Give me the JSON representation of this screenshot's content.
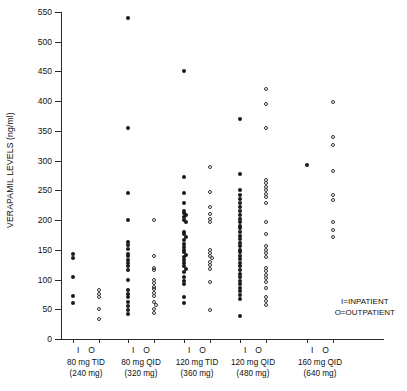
{
  "chart_data": {
    "type": "scatter",
    "title": "",
    "xlabel": "",
    "ylabel": "VERAPAMIL LEVELS (ng/ml)",
    "ylim": [
      0,
      550
    ],
    "ytick_step": 50,
    "yticks": [
      0,
      50,
      100,
      150,
      200,
      250,
      300,
      350,
      400,
      450,
      500,
      550
    ],
    "grid": false,
    "legend_position": "bottom-right",
    "legend": [
      {
        "symbol": "I",
        "label": "I=INPATIENT",
        "marker": "filled-circle"
      },
      {
        "symbol": "O",
        "label": "O=OUTPATIENT",
        "marker": "open-circle"
      }
    ],
    "column_labels": [
      "I",
      "O"
    ],
    "groups": [
      {
        "name": "80 mg TID",
        "dose_line1": "80 mg TID",
        "dose_line2": "(240 mg)",
        "total_dose_mg": 240,
        "series": [
          {
            "name": "I",
            "marker": "filled-circle",
            "values": [
              143,
              137,
              105,
              73,
              60
            ]
          },
          {
            "name": "O",
            "marker": "open-circle",
            "values": [
              82,
              76,
              71,
              50,
              33
            ]
          }
        ]
      },
      {
        "name": "80 mg QID",
        "dose_line1": "80 mg QID",
        "dose_line2": "(320 mg)",
        "total_dose_mg": 320,
        "series": [
          {
            "name": "I",
            "marker": "filled-circle",
            "values": [
              540,
              355,
              245,
              200,
              163,
              158,
              152,
              143,
              139,
              133,
              128,
              122,
              116,
              100,
              82,
              76,
              70,
              62,
              55,
              48,
              42
            ]
          },
          {
            "name": "O",
            "marker": "open-circle",
            "values": [
              200,
              140,
              120,
              116,
              100,
              95,
              88,
              84,
              78,
              72,
              62,
              57,
              50,
              44
            ]
          }
        ]
      },
      {
        "name": "120 mg TID",
        "dose_line1": "120 mg TID",
        "dose_line2": "(360 mg)",
        "total_dose_mg": 360,
        "series": [
          {
            "name": "I",
            "marker": "filled-circle",
            "values": [
              450,
              272,
              245,
              228,
              215,
              212,
              208,
              205,
              200,
              196,
              180,
              176,
              172,
              166,
              160,
              155,
              150,
              146,
              142,
              138,
              133,
              128,
              122,
              118,
              112,
              104,
              98,
              92,
              70,
              60
            ]
          },
          {
            "name": "O",
            "marker": "open-circle",
            "values": [
              290,
              248,
              222,
              210,
              202,
              196,
              150,
              144,
              140,
              136,
              130,
              124,
              118,
              96,
              48
            ]
          }
        ]
      },
      {
        "name": "120 mg QID",
        "dose_line1": "120 mg QID",
        "dose_line2": "(480 mg)",
        "total_dose_mg": 480,
        "series": [
          {
            "name": "I",
            "marker": "filled-circle",
            "values": [
              370,
              278,
              250,
              242,
              236,
              228,
              222,
              215,
              208,
              202,
              196,
              190,
              186,
              180,
              174,
              168,
              162,
              156,
              150,
              146,
              140,
              134,
              128,
              122,
              116,
              110,
              104,
              98,
              92,
              86,
              80,
              74,
              68,
              38
            ]
          },
          {
            "name": "O",
            "marker": "open-circle",
            "values": [
              420,
              395,
              355,
              268,
              262,
              256,
              250,
              244,
              238,
              228,
              196,
              176,
              156,
              150,
              144,
              138,
              120,
              114,
              108,
              102,
              96,
              86,
              70,
              64,
              58
            ]
          }
        ]
      },
      {
        "name": "160 mg QID",
        "dose_line1": "160 mg QID",
        "dose_line2": "(640 mg)",
        "total_dose_mg": 640,
        "series": [
          {
            "name": "I",
            "marker": "filled-circle",
            "values": [
              293
            ]
          },
          {
            "name": "O",
            "marker": "open-circle",
            "values": [
              398,
              340,
              326,
              282,
              242,
              234,
              196,
              184,
              172
            ]
          }
        ]
      }
    ]
  }
}
